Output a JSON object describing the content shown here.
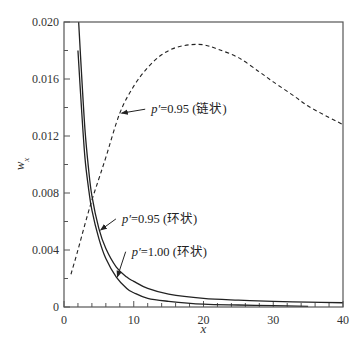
{
  "chart_data": {
    "type": "line",
    "title": "",
    "xlabel": "x",
    "ylabel": "w_x",
    "xlim": [
      0,
      40
    ],
    "ylim": [
      0,
      0.02
    ],
    "grid": false,
    "legend": "inline annotations with arrows",
    "x_ticks": [
      0,
      10,
      20,
      30,
      40
    ],
    "x_tick_labels": [
      "0",
      "10",
      "20",
      "30",
      "40"
    ],
    "x_minor_step": 2,
    "y_ticks": [
      0,
      0.004,
      0.008,
      0.012,
      0.016,
      0.02
    ],
    "y_tick_labels": [
      "0",
      "0.004",
      "0.008",
      "0.012",
      "0.016",
      "0.020"
    ],
    "y_minor_step": 0.002,
    "origin_x_label": "0",
    "series": [
      {
        "name": "p'=0.95 (链状)",
        "style": "dashed",
        "x": [
          1,
          2,
          3,
          4,
          5,
          6,
          8,
          10,
          12,
          14,
          16,
          18,
          20,
          22,
          25,
          28,
          30,
          33,
          35,
          38,
          40
        ],
        "y": [
          0.0023,
          0.004,
          0.0058,
          0.0075,
          0.009,
          0.0105,
          0.0136,
          0.0155,
          0.0168,
          0.0177,
          0.0182,
          0.0184,
          0.0184,
          0.0181,
          0.0175,
          0.0165,
          0.0158,
          0.0148,
          0.0141,
          0.0133,
          0.0128
        ]
      },
      {
        "name": "p'=0.95 (环状)",
        "style": "solid",
        "x": [
          2.1,
          2.5,
          3,
          3.5,
          4,
          5,
          6,
          7.5,
          9,
          10,
          12,
          15,
          20,
          25,
          30,
          35,
          40
        ],
        "y": [
          0.02,
          0.0165,
          0.0125,
          0.0098,
          0.0078,
          0.0055,
          0.0041,
          0.0028,
          0.0021,
          0.0018,
          0.0013,
          0.0009,
          0.0006,
          0.00048,
          0.0004,
          0.00034,
          0.0003
        ]
      },
      {
        "name": "p'=1.00 (环状)",
        "style": "solid",
        "x": [
          2,
          2.5,
          3,
          3.5,
          4,
          5,
          6,
          7.5,
          9,
          10,
          12,
          15,
          20,
          25,
          30,
          35
        ],
        "y": [
          0.018,
          0.014,
          0.0105,
          0.0084,
          0.0068,
          0.0048,
          0.0034,
          0.0021,
          0.0013,
          0.001,
          0.0006,
          0.0004,
          0.0002,
          0.00014,
          0.0001,
          5e-05
        ]
      }
    ],
    "annotations": [
      {
        "text": "p′=0.95 (链状)",
        "prefix": "p′",
        "rest": "=0.95 (链状)",
        "arrow_to": [
          8.1,
          0.0136
        ],
        "text_at": [
          12.5,
          0.0136
        ]
      },
      {
        "text": "p′=0.95 (环状)",
        "prefix": "p′",
        "rest": "=0.95 (环状)",
        "arrow_to": [
          5.1,
          0.0054
        ],
        "text_at": [
          8.3,
          0.0059
        ]
      },
      {
        "text": "p′=1.00 (环状)",
        "prefix": "p′",
        "rest": "=1.00 (环状)",
        "arrow_to": [
          7.5,
          0.0021
        ],
        "text_at": [
          9.7,
          0.0036
        ]
      }
    ]
  },
  "colors": {
    "axis": "#555555",
    "curve": "#222222",
    "text": "#333333",
    "background": "#ffffff"
  }
}
